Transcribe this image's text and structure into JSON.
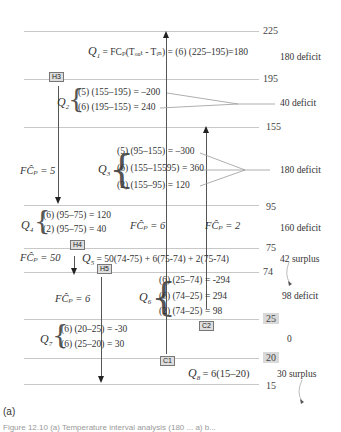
{
  "temperature_levels": [
    {
      "label": "225",
      "boxed": false
    },
    {
      "label": "195",
      "boxed": false
    },
    {
      "label": "155",
      "boxed": false
    },
    {
      "label": "95",
      "boxed": false
    },
    {
      "label": "75",
      "boxed": false
    },
    {
      "label": "74",
      "boxed": false
    },
    {
      "label": "25",
      "boxed": true
    },
    {
      "label": "20",
      "boxed": true
    },
    {
      "label": "15",
      "boxed": false
    }
  ],
  "intervals": {
    "q1": {
      "label": "Q",
      "sub": "1",
      "equation": "= FCₚ(Tₒᵤₜ - Tᵢₙ) = (6) (225–195)=180",
      "status": "180 deficit"
    },
    "q2": {
      "label": "Q",
      "sub": "2",
      "lines": [
        "(5) (155–195) = –200",
        "(6) (195–155) = 240"
      ],
      "status": "40 deficit"
    },
    "q3": {
      "label": "Q",
      "sub": "3",
      "lines": [
        "(5) (95–155) = –300",
        "(6) (155–15595) = 360",
        "(2) (155–95) = 120"
      ],
      "status": "180 deficit"
    },
    "q4": {
      "label": "Q",
      "sub": "4",
      "lines": [
        "(6) (95–75) = 120",
        "(2) (95–75) = 40"
      ],
      "status": "160 deficit"
    },
    "q5": {
      "label": "Q",
      "sub": "5",
      "equation": "= 50(74-75) + 6(75-74) + 2(75-74)",
      "status": "42 surplus"
    },
    "q6": {
      "label": "Q",
      "sub": "6",
      "lines": [
        "(6) (25–74) = -294",
        "(6) (74–25) = 294",
        "(2) (74–25) = 98"
      ],
      "status": "98 deficit"
    },
    "q7": {
      "label": "Q",
      "sub": "7",
      "lines": [
        "(6) (20–25) = -30",
        "(6) (25–20) = 30"
      ],
      "status": "0"
    },
    "q8": {
      "label": "Q",
      "sub": "8",
      "equation": "= 6(15–20)",
      "status": "30 surplus"
    }
  },
  "streams": {
    "h3": {
      "tag": "H3",
      "fcp": "FĈₚ = 5"
    },
    "h4": {
      "tag": "H4",
      "fcp": "FĈₚ = 50"
    },
    "h5": {
      "tag": "H5",
      "fcp": "FĈₚ = 6"
    },
    "c1": {
      "tag": "C1",
      "fcp": "FĈₚ = 6"
    },
    "c2": {
      "tag": "C2",
      "fcp": "FĈₚ = 2"
    }
  },
  "caption": "(a)",
  "figure_caption": "Figure 12.10 (a) Temperature interval analysis (180 ... a) b..."
}
